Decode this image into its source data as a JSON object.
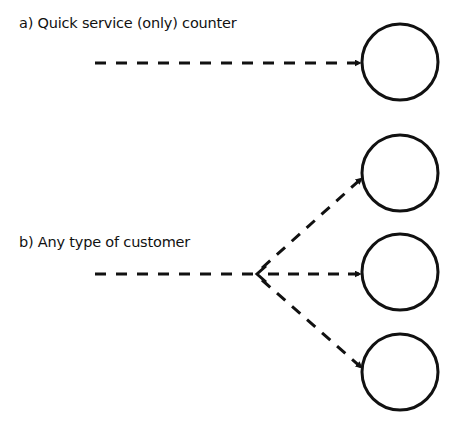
{
  "diagram": {
    "sections": [
      {
        "label": "a) Quick service (only) counter",
        "servers": 1
      },
      {
        "label": "b) Any type of customer",
        "servers": 3
      }
    ],
    "colors": {
      "stroke": "#111111",
      "background": "#ffffff"
    }
  }
}
